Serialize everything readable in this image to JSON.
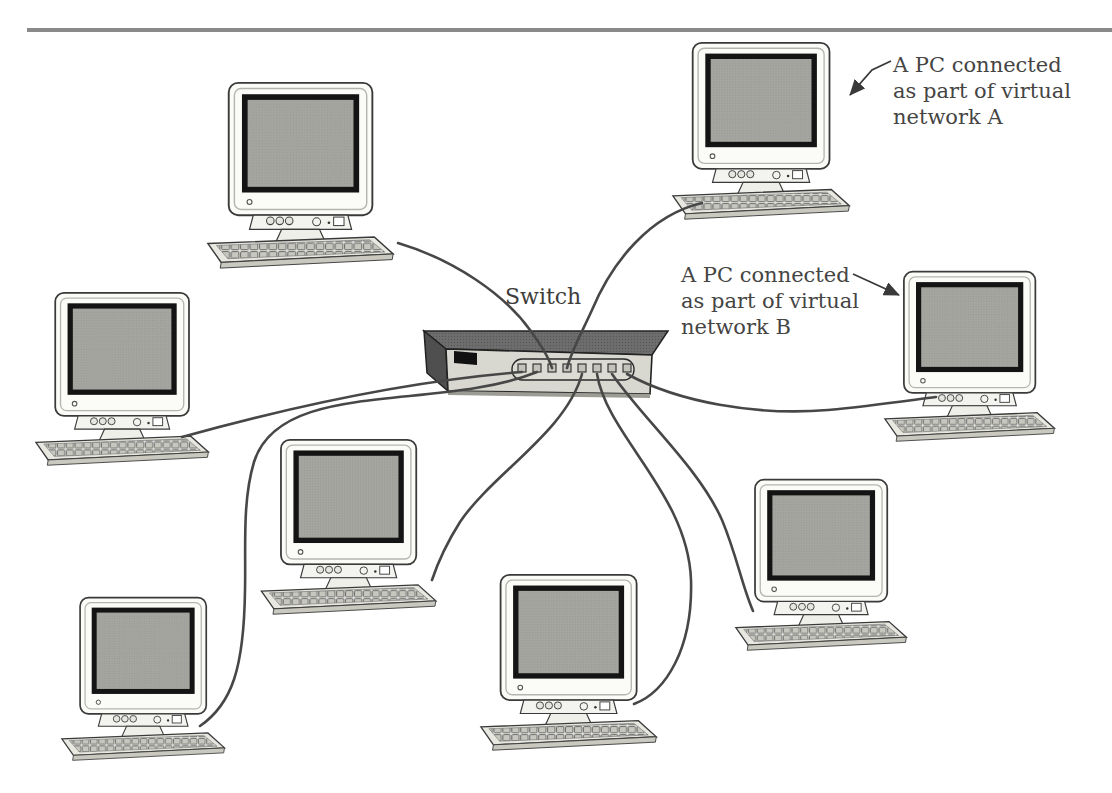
{
  "figure": {
    "switch": {
      "label": "Switch",
      "port_count": 8
    },
    "pc_count": 8,
    "annotations": {
      "a": {
        "line1": "A PC connected",
        "line2": "as part of virtual",
        "line3": "network A"
      },
      "b": {
        "line1": "A PC connected",
        "line2": "as part of virtual",
        "line3": "network B"
      }
    },
    "colors": {
      "top_rule": "#8a8a8a",
      "cable": "#474747",
      "annotation_text": "#454543",
      "monitor_body": "#fbfbf8",
      "screen_gray": "#a7a7a2",
      "bezel_black": "#141414",
      "switch_top": "#6b6b6b",
      "switch_end_cap": "#4f4f4f",
      "switch_front": "#d8d8d0"
    }
  }
}
